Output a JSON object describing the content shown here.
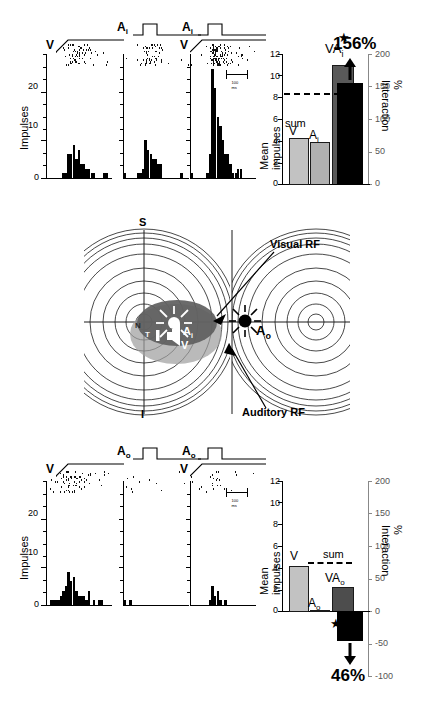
{
  "figure": {
    "axis_impulses_label": "Impulses",
    "axis_mean_impulses_label": "Mean impulses",
    "axis_interaction_label": "% Interaction",
    "scalebar_label": "100 ms"
  },
  "top_section": {
    "stim_labels": {
      "v": "V",
      "a": "A",
      "a_sub": "i"
    },
    "panels": [
      {
        "id": "panel-v",
        "stimulus": "V",
        "modality": "visual"
      },
      {
        "id": "panel-ai",
        "stimulus": "Ai",
        "modality": "auditory-inside"
      },
      {
        "id": "panel-vai",
        "stimulus": "VAi",
        "modality": "combined"
      }
    ],
    "hist_axis": {
      "ticks": [
        "0",
        "10",
        "20"
      ],
      "ymax": 26
    },
    "barchart": {
      "bars": [
        {
          "label": "V",
          "sub": "",
          "value": 4.3,
          "color": "#c2c2c2"
        },
        {
          "label": "A",
          "sub": "i",
          "value": 3.9,
          "color": "#b0b0b0"
        },
        {
          "label": "VA",
          "sub": "i",
          "value": 11.0,
          "color": "#595959"
        }
      ],
      "sum_label": "sum",
      "sum_value": 8.2,
      "significance": "★",
      "left_ticks": [
        "0",
        "2",
        "4",
        "6",
        "8",
        "10",
        "12"
      ],
      "left_max": 12,
      "right_ticks": [
        "0",
        "50",
        "100",
        "150",
        "200"
      ],
      "right_max": 200,
      "interaction_bar_value": 156,
      "interaction_label": "156%",
      "interaction_direction": "up"
    }
  },
  "diagram": {
    "labels": {
      "superior": "S",
      "inferior": "I",
      "nasal": "N",
      "temporal": "T",
      "visual_rf": "Visual RF",
      "auditory_rf": "Auditory RF",
      "a_inside": "A",
      "a_inside_sub": "i",
      "a_outside": "A",
      "a_outside_sub": "o",
      "v_marker": "V"
    }
  },
  "bottom_section": {
    "stim_labels": {
      "v": "V",
      "a": "A",
      "a_sub": "o"
    },
    "panels": [
      {
        "id": "panel-v-b",
        "stimulus": "V",
        "modality": "visual"
      },
      {
        "id": "panel-ao",
        "stimulus": "Ao",
        "modality": "auditory-outside"
      },
      {
        "id": "panel-vao",
        "stimulus": "VAo",
        "modality": "combined"
      }
    ],
    "hist_axis": {
      "ticks": [
        "0",
        "10",
        "20"
      ],
      "ymax": 26
    },
    "barchart": {
      "bars": [
        {
          "label": "V",
          "sub": "",
          "value": 4.25,
          "color": "#c2c2c2"
        },
        {
          "label": "A",
          "sub": "o",
          "value": 0.12,
          "color": "#b0b0b0"
        },
        {
          "label": "VA",
          "sub": "o",
          "value": 2.3,
          "color": "#4d4d4d"
        }
      ],
      "sum_label": "sum",
      "sum_value": 4.4,
      "significance": "★",
      "left_ticks": [
        "0",
        "2",
        "4",
        "6",
        "8",
        "10",
        "12"
      ],
      "left_max": 12,
      "right_ticks": [
        "-100",
        "-50",
        "0",
        "50",
        "100",
        "150",
        "200"
      ],
      "right_max": 200,
      "right_min": -100,
      "interaction_bar_value": -46,
      "interaction_label": "46%",
      "interaction_direction": "down"
    }
  },
  "chart_data": [
    {
      "type": "bar",
      "id": "top-psth-V",
      "title": "PSTH visual alone (top)",
      "xlabel": "time",
      "ylabel": "Impulses",
      "ylim": [
        0,
        26
      ],
      "yticks": [
        0,
        10,
        20
      ],
      "values": [
        0,
        0,
        0,
        0,
        0,
        0,
        1,
        1,
        5,
        5,
        7,
        4,
        6,
        3,
        3,
        2,
        2,
        1,
        1,
        0,
        0,
        0,
        1,
        1,
        0
      ]
    },
    {
      "type": "bar",
      "id": "top-psth-Ai",
      "title": "PSTH auditory-inside alone (top)",
      "xlabel": "time",
      "ylabel": "Impulses",
      "ylim": [
        0,
        26
      ],
      "yticks": [
        0,
        10,
        20
      ],
      "values": [
        1,
        0,
        0,
        0,
        0,
        1,
        1,
        2,
        8,
        6,
        5,
        4,
        4,
        3,
        3,
        0,
        0,
        0,
        0,
        0,
        0,
        0,
        1,
        0,
        0
      ]
    },
    {
      "type": "bar",
      "id": "top-psth-VAi",
      "title": "PSTH combined visual+auditory-inside (top)",
      "xlabel": "time",
      "ylabel": "Impulses",
      "ylim": [
        0,
        26
      ],
      "yticks": [
        0,
        10,
        20
      ],
      "values": [
        1,
        0,
        0,
        0,
        0,
        0,
        1,
        5,
        23,
        19,
        13,
        11,
        8,
        5,
        5,
        3,
        1,
        1,
        2,
        2,
        0,
        0,
        0,
        0,
        0
      ]
    },
    {
      "type": "bar",
      "id": "top-mean-impulses",
      "title": "Mean impulses (top)",
      "categories": [
        "V",
        "Ai",
        "VAi"
      ],
      "values": [
        4.3,
        3.9,
        11.0
      ],
      "ylabel": "Mean impulses",
      "ylim": [
        0,
        12
      ],
      "yticks": [
        0,
        2,
        4,
        6,
        8,
        10,
        12
      ],
      "annotations": [
        {
          "text": "sum",
          "value": 8.2
        },
        {
          "text": "★",
          "on": "VAi"
        }
      ]
    },
    {
      "type": "bar",
      "id": "top-interaction",
      "title": "% Interaction (top)",
      "categories": [
        "VAi"
      ],
      "values": [
        156
      ],
      "ylabel": "% Interaction",
      "ylim": [
        0,
        200
      ],
      "yticks": [
        0,
        50,
        100,
        150,
        200
      ],
      "annotations": [
        {
          "text": "156%"
        }
      ]
    },
    {
      "type": "bar",
      "id": "bottom-psth-V",
      "title": "PSTH visual alone (bottom)",
      "xlabel": "time",
      "ylabel": "Impulses",
      "ylim": [
        0,
        26
      ],
      "yticks": [
        0,
        10,
        20
      ],
      "values": [
        0,
        1,
        1,
        1,
        1,
        2,
        3,
        4,
        7,
        5,
        6,
        3,
        2,
        2,
        2,
        1,
        3,
        0,
        1,
        0,
        1,
        1,
        0,
        0,
        0
      ]
    },
    {
      "type": "bar",
      "id": "bottom-psth-Ao",
      "title": "PSTH auditory-outside alone (bottom)",
      "xlabel": "time",
      "ylabel": "Impulses",
      "ylim": [
        0,
        26
      ],
      "yticks": [
        0,
        10,
        20
      ],
      "values": [
        1,
        0,
        1,
        0,
        0,
        0,
        0,
        0,
        0,
        0,
        0,
        0,
        0,
        0,
        0,
        0,
        0,
        0,
        0,
        0,
        0,
        0,
        0,
        0,
        0
      ]
    },
    {
      "type": "bar",
      "id": "bottom-psth-VAo",
      "title": "PSTH combined visual+auditory-outside (bottom)",
      "xlabel": "time",
      "ylabel": "Impulses",
      "ylim": [
        0,
        26
      ],
      "yticks": [
        0,
        10,
        20
      ],
      "values": [
        0,
        0,
        0,
        0,
        0,
        0,
        0,
        1,
        4,
        2,
        3,
        1,
        0,
        1,
        0,
        0,
        0,
        0,
        0,
        0,
        0,
        0,
        0,
        0,
        0
      ]
    },
    {
      "type": "bar",
      "id": "bottom-mean-impulses",
      "title": "Mean impulses (bottom)",
      "categories": [
        "V",
        "Ao",
        "VAo"
      ],
      "values": [
        4.25,
        0.12,
        2.3
      ],
      "ylabel": "Mean impulses",
      "ylim": [
        0,
        12
      ],
      "yticks": [
        0,
        2,
        4,
        6,
        8,
        10,
        12
      ],
      "annotations": [
        {
          "text": "sum",
          "value": 4.4
        },
        {
          "text": "★",
          "on": "VAo"
        }
      ]
    },
    {
      "type": "bar",
      "id": "bottom-interaction",
      "title": "% Interaction (bottom)",
      "categories": [
        "VAo"
      ],
      "values": [
        -46
      ],
      "ylabel": "% Interaction",
      "ylim": [
        -100,
        200
      ],
      "yticks": [
        -100,
        -50,
        0,
        50,
        100,
        150,
        200
      ],
      "annotations": [
        {
          "text": "46%"
        }
      ]
    }
  ]
}
